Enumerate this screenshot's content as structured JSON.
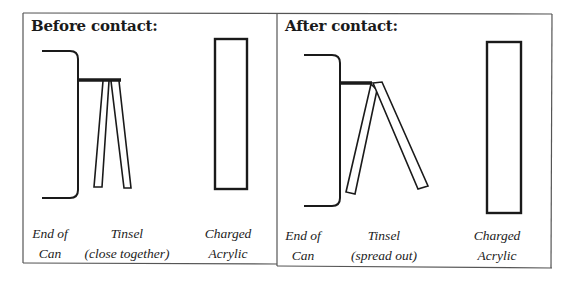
{
  "panels": [
    {
      "id": "before",
      "title": "Before contact:",
      "labels": {
        "can": [
          "End of",
          "Can"
        ],
        "tinsel": [
          "Tinsel",
          "(close together)"
        ],
        "acrylic": [
          "Charged",
          "Acrylic"
        ]
      }
    },
    {
      "id": "after",
      "title": "After contact:",
      "labels": {
        "can": [
          "End of",
          "Can"
        ],
        "tinsel": [
          "Tinsel",
          "(spread out)"
        ],
        "acrylic": [
          "Charged",
          "Acrylic"
        ]
      }
    }
  ],
  "colors": {
    "stroke": "#1a1a1a",
    "frame": "#555555",
    "background": "#ffffff"
  }
}
